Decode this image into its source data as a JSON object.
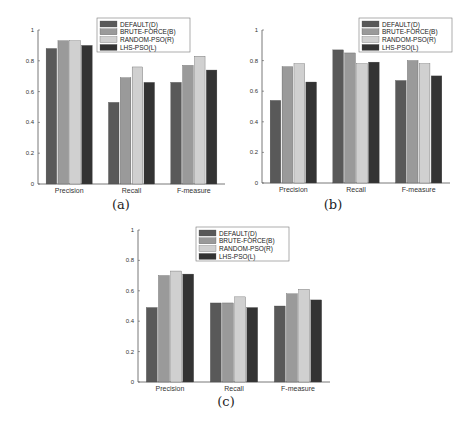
{
  "legend": {
    "entries": [
      "DEFAULT(D)",
      "BRUTE-FORCE(B)",
      "RANDOM-PSO(R)",
      "LHS-PSO(L)"
    ],
    "colors": [
      "#595959",
      "#9a9a9a",
      "#d0d0d0",
      "#333333"
    ]
  },
  "captions": {
    "a": "(a)",
    "b": "(b)",
    "c": "(c)"
  },
  "chart_data": [
    {
      "type": "bar",
      "id": "a",
      "title": "",
      "caption": "(a)",
      "categories": [
        "Precision",
        "Recall",
        "F-measure"
      ],
      "series": [
        {
          "name": "DEFAULT(D)",
          "values": [
            0.88,
            0.53,
            0.66
          ]
        },
        {
          "name": "BRUTE-FORCE(B)",
          "values": [
            0.93,
            0.69,
            0.77
          ]
        },
        {
          "name": "RANDOM-PSO(R)",
          "values": [
            0.93,
            0.76,
            0.83
          ]
        },
        {
          "name": "LHS-PSO(L)",
          "values": [
            0.9,
            0.66,
            0.74
          ]
        }
      ],
      "xlabel": "",
      "ylabel": "",
      "ylim": [
        0,
        1
      ],
      "yticks": [
        "0",
        "0.2",
        "0.4",
        "0.6",
        "0.8",
        "1"
      ],
      "grid": false,
      "legend_position": "upper center"
    },
    {
      "type": "bar",
      "id": "b",
      "title": "",
      "caption": "(b)",
      "categories": [
        "Precision",
        "Recall",
        "F-measure"
      ],
      "series": [
        {
          "name": "DEFAULT(D)",
          "values": [
            0.54,
            0.87,
            0.67
          ]
        },
        {
          "name": "BRUTE-FORCE(B)",
          "values": [
            0.76,
            0.85,
            0.8
          ]
        },
        {
          "name": "RANDOM-PSO(R)",
          "values": [
            0.78,
            0.78,
            0.78
          ]
        },
        {
          "name": "LHS-PSO(L)",
          "values": [
            0.66,
            0.79,
            0.7
          ]
        }
      ],
      "xlabel": "",
      "ylabel": "",
      "ylim": [
        0,
        1
      ],
      "yticks": [
        "0",
        "0.2",
        "0.4",
        "0.6",
        "0.8",
        "1"
      ],
      "grid": false,
      "legend_position": "upper right"
    },
    {
      "type": "bar",
      "id": "c",
      "title": "",
      "caption": "(c)",
      "categories": [
        "Precision",
        "Recall",
        "F-measure"
      ],
      "series": [
        {
          "name": "DEFAULT(D)",
          "values": [
            0.49,
            0.52,
            0.5
          ]
        },
        {
          "name": "BRUTE-FORCE(B)",
          "values": [
            0.7,
            0.52,
            0.58
          ]
        },
        {
          "name": "RANDOM-PSO(R)",
          "values": [
            0.73,
            0.56,
            0.61
          ]
        },
        {
          "name": "LHS-PSO(L)",
          "values": [
            0.71,
            0.49,
            0.54
          ]
        }
      ],
      "xlabel": "",
      "ylabel": "",
      "ylim": [
        0,
        1
      ],
      "yticks": [
        "0",
        "0.2",
        "0.4",
        "0.6",
        "0.8",
        "1"
      ],
      "grid": false,
      "legend_position": "upper center"
    }
  ]
}
